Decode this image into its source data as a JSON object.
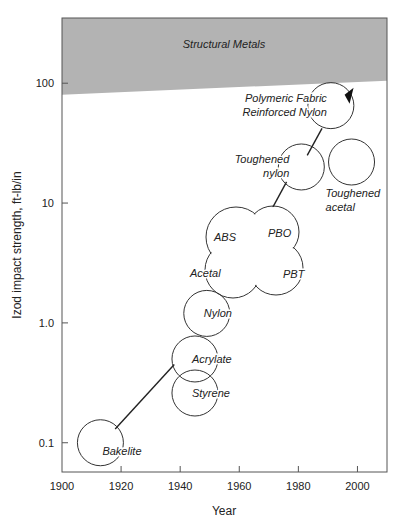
{
  "chart_data": {
    "type": "scatter",
    "title": "",
    "xlabel": "Year",
    "ylabel": "Izod impact strength, ft-lb/in",
    "xlim": [
      1900,
      2010
    ],
    "ylim": [
      0.057,
      350
    ],
    "yscale": "log",
    "grid": false,
    "xticks": [
      {
        "value": 1900,
        "label": "1900"
      },
      {
        "value": 1920,
        "label": "1920"
      },
      {
        "value": 1940,
        "label": "1940"
      },
      {
        "value": 1960,
        "label": "1960"
      },
      {
        "value": 1980,
        "label": "1980"
      },
      {
        "value": 2000,
        "label": "2000"
      }
    ],
    "yticks": [
      {
        "value": 100,
        "label": "100"
      },
      {
        "value": 10,
        "label": "10"
      },
      {
        "value": 1,
        "label": "1.0"
      },
      {
        "value": 0.1,
        "label": "0.1"
      }
    ],
    "band": {
      "label": "Structural Metals",
      "lower_left": [
        1900,
        80
      ],
      "lower_right": [
        2010,
        105
      ],
      "color": "#b3b3b3"
    },
    "materials": [
      {
        "name": "Bakelite",
        "year": 1913,
        "strength": 0.1,
        "label_lines": [
          "Bakelite"
        ],
        "label_offset": "right-below"
      },
      {
        "name": "Styrene",
        "year": 1945,
        "strength": 0.26,
        "label_lines": [
          "Styrene"
        ],
        "label_offset": "inside-right"
      },
      {
        "name": "Acrylate",
        "year": 1945,
        "strength": 0.5,
        "label_lines": [
          "Acrylate"
        ],
        "label_offset": "inside-right"
      },
      {
        "name": "Nylon",
        "year": 1949,
        "strength": 1.2,
        "label_lines": [
          "Nylon"
        ],
        "label_offset": "inside-right"
      },
      {
        "name": "Toughened nylon",
        "year": 1981,
        "strength": 20,
        "label_lines": [
          "Toughened",
          "nylon"
        ],
        "label_offset": "left"
      },
      {
        "name": "Toughened acetal",
        "year": 1998,
        "strength": 22,
        "label_lines": [
          "Toughened",
          "acetal"
        ],
        "label_offset": "below"
      },
      {
        "name": "Polymeric Fabric Reinforced Nylon",
        "year": 1991,
        "strength": 65,
        "label_lines": [
          "Polymeric Fabric",
          "Reinforced Nylon"
        ],
        "label_offset": "left"
      }
    ],
    "cluster": {
      "members": [
        {
          "name": "ABS",
          "year": 1952,
          "strength": 4.0
        },
        {
          "name": "PBO",
          "year": 1969,
          "strength": 5.0
        },
        {
          "name": "Acetal",
          "year": 1950,
          "strength": 2.0
        },
        {
          "name": "PBT",
          "year": 1974,
          "strength": 2.3
        }
      ]
    },
    "trend_segments": [
      {
        "from": [
          1918,
          0.13
        ],
        "to": [
          1938,
          0.45
        ]
      },
      {
        "from": [
          1970,
          8.0
        ],
        "to": [
          1976,
          15
        ]
      },
      {
        "from": [
          1983,
          25
        ],
        "to": [
          1988,
          42
        ]
      }
    ],
    "arrow": {
      "year": 1997,
      "strength": 80
    }
  }
}
